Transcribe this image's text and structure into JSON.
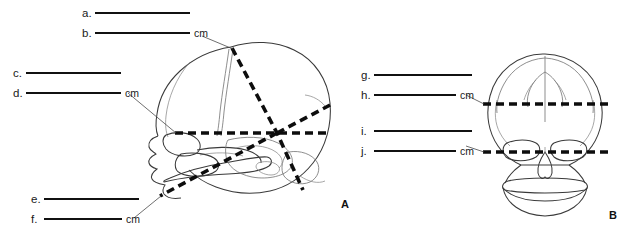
{
  "figure": {
    "type": "anatomical-line-drawing",
    "views": [
      {
        "id": "A",
        "label": "A",
        "orientation": "lateral (side) view"
      },
      {
        "id": "B",
        "label": "B",
        "orientation": "anterior (front) view"
      }
    ],
    "unit_label": "cm"
  },
  "blanks": {
    "left_group_top": [
      {
        "letter": "a.",
        "unit": "",
        "rule_width": 95
      },
      {
        "letter": "b.",
        "unit": "cm",
        "rule_width": 95
      }
    ],
    "left_group_mid": [
      {
        "letter": "c.",
        "unit": "",
        "rule_width": 95
      },
      {
        "letter": "d.",
        "unit": "cm",
        "rule_width": 95
      }
    ],
    "left_group_bottom": [
      {
        "letter": "e.",
        "unit": "",
        "rule_width": 95
      },
      {
        "letter": "f.",
        "unit": "cm",
        "rule_width": 78
      }
    ],
    "right_group_top": [
      {
        "letter": "g.",
        "unit": "",
        "rule_width": 98
      },
      {
        "letter": "h.",
        "unit": "cm",
        "rule_width": 82
      }
    ],
    "right_group_bottom": [
      {
        "letter": "i.",
        "unit": "",
        "rule_width": 98
      },
      {
        "letter": "j.",
        "unit": "cm",
        "rule_width": 82
      }
    ]
  },
  "colors": {
    "ink": "#111111",
    "outline": "#3a3a3a",
    "suture": "#6b6b6b",
    "background": "#ffffff"
  }
}
